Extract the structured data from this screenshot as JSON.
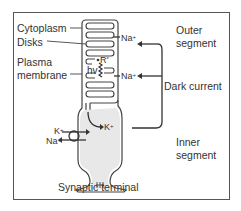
{
  "diagram": {
    "labels": {
      "cytoplasm": "Cytoplasm",
      "disks": "Disks",
      "plasma_membrane_1": "Plasma",
      "plasma_membrane_2": "membrane",
      "outer_segment_1": "Outer",
      "outer_segment_2": "segment",
      "dark_current": "Dark current",
      "inner_segment_1": "Inner",
      "inner_segment_2": "segment",
      "synaptic_terminal": "Synaptic terminal"
    },
    "ions": {
      "na_top": "Na",
      "na_mid": "Na",
      "k_inner": "K",
      "k_left": "K",
      "na_left": "Na",
      "charge": "+"
    },
    "photon": {
      "hv": "hv",
      "r_star": "R",
      "r_star_sup": "*"
    }
  }
}
